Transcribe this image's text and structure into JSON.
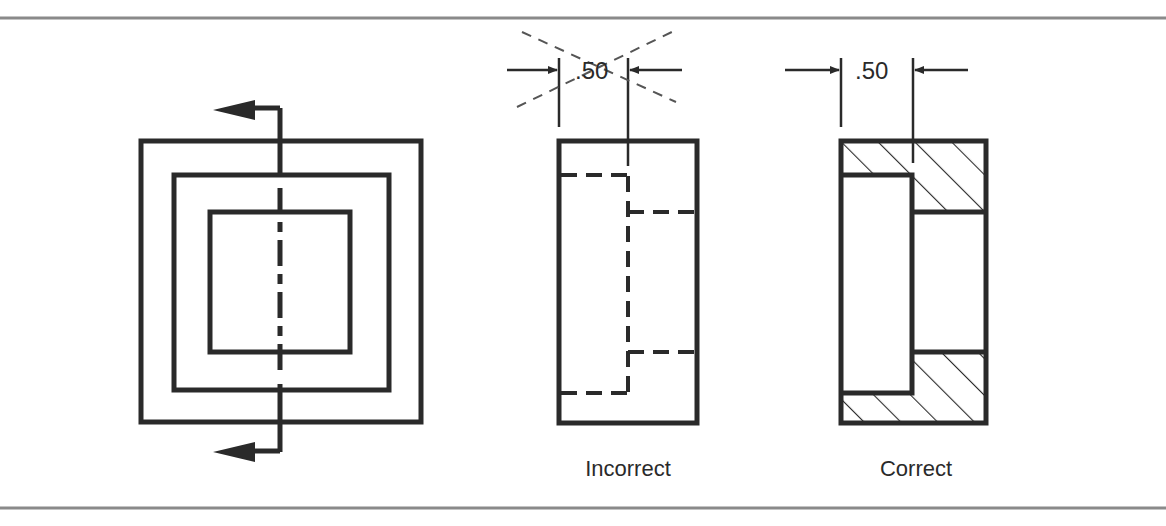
{
  "figure": {
    "colors": {
      "line": "#2a2a2a",
      "rule": "#8a8a8a",
      "background": "#ffffff"
    }
  },
  "views": {
    "front": {
      "name": "Front view with cutting-plane line"
    },
    "incorrect": {
      "label": "Incorrect",
      "dimension": ".50"
    },
    "correct": {
      "label": "Correct",
      "dimension": ".50"
    }
  }
}
